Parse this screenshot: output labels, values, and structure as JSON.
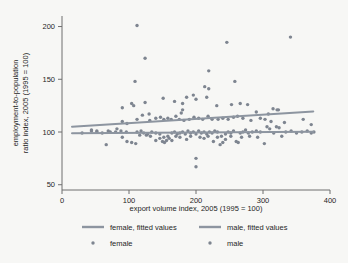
{
  "chart_data": {
    "type": "scatter",
    "title": "",
    "xlabel": "export volume index, 2005 (1995 = 100)",
    "ylabel": "employment-to-population ratio index, 2005 (1995 = 100)",
    "ylabel_line1": "employment-to-population",
    "ylabel_line2": "ratio index, 2005 (1995 = 100)",
    "xlim": [
      0,
      400
    ],
    "ylim": [
      45,
      210
    ],
    "xticks": [
      0,
      100,
      200,
      300,
      400
    ],
    "yticks": [
      50,
      100,
      150,
      200
    ],
    "xtick_labels": [
      "0",
      "100",
      "200",
      "300",
      "400"
    ],
    "ytick_labels": [
      "50",
      "100",
      "150",
      "200"
    ],
    "grid": false,
    "legend_position": "bottom",
    "point_color": "#7e8590",
    "line_color": "#8d95a0",
    "background_color": "#f7f7f5",
    "legend": [
      {
        "key": "female-fitted",
        "label": "female, fitted values",
        "marker": "line"
      },
      {
        "key": "male-fitted",
        "label": "male, fitted values",
        "marker": "line"
      },
      {
        "key": "female",
        "label": "female",
        "marker": "dot"
      },
      {
        "key": "male",
        "label": "male",
        "marker": "dot"
      }
    ],
    "fitted_lines": [
      {
        "name": "female, fitted values",
        "x": [
          15,
          375
        ],
        "y": [
          105.0,
          119.5
        ]
      },
      {
        "name": "male, fitted values",
        "x": [
          15,
          375
        ],
        "y": [
          98.8,
          100.2
        ]
      }
    ],
    "series": [
      {
        "name": "female",
        "points": [
          [
            112,
            201
          ],
          [
            124,
            170
          ],
          [
            109,
            148
          ],
          [
            90,
            123
          ],
          [
            104,
            127
          ],
          [
            107,
            125
          ],
          [
            124,
            128
          ],
          [
            130,
            117
          ],
          [
            151,
            132
          ],
          [
            168,
            129
          ],
          [
            180,
            127
          ],
          [
            186,
            133
          ],
          [
            196,
            135
          ],
          [
            200,
            131
          ],
          [
            178,
            118
          ],
          [
            180,
            121
          ],
          [
            219,
            158
          ],
          [
            213,
            143
          ],
          [
            219,
            141
          ],
          [
            216,
            133
          ],
          [
            231,
            125
          ],
          [
            246,
            185
          ],
          [
            258,
            148
          ],
          [
            253,
            126
          ],
          [
            266,
            127
          ],
          [
            277,
            126
          ],
          [
            290,
            119
          ],
          [
            308,
            117
          ],
          [
            315,
            122
          ],
          [
            321,
            121
          ],
          [
            323,
            121
          ],
          [
            341,
            190
          ],
          [
            112,
            112
          ],
          [
            120,
            116
          ],
          [
            131,
            111
          ],
          [
            140,
            113
          ],
          [
            147,
            114
          ],
          [
            152,
            112
          ],
          [
            158,
            113
          ],
          [
            163,
            112
          ],
          [
            170,
            115
          ],
          [
            175,
            112
          ],
          [
            182,
            111
          ],
          [
            190,
            112
          ],
          [
            197,
            114
          ],
          [
            204,
            113
          ],
          [
            210,
            112
          ],
          [
            218,
            115
          ],
          [
            224,
            112
          ],
          [
            233,
            112
          ],
          [
            240,
            113
          ],
          [
            248,
            112
          ],
          [
            256,
            114
          ],
          [
            262,
            115
          ],
          [
            270,
            113
          ],
          [
            282,
            111
          ],
          [
            296,
            113
          ],
          [
            303,
            112
          ],
          [
            312,
            110
          ],
          [
            332,
            109
          ],
          [
            360,
            112
          ],
          [
            372,
            107
          ],
          [
            90,
            110
          ],
          [
            97,
            108
          ],
          [
            82,
            103
          ],
          [
            69,
            101
          ],
          [
            52,
            101
          ],
          [
            44,
            101
          ],
          [
            30,
            99
          ]
        ]
      },
      {
        "name": "male",
        "points": [
          [
            66,
            88
          ],
          [
            90,
            95
          ],
          [
            97,
            91
          ],
          [
            104,
            90
          ],
          [
            110,
            89
          ],
          [
            116,
            97
          ],
          [
            122,
            99
          ],
          [
            128,
            98
          ],
          [
            134,
            100
          ],
          [
            140,
            99
          ],
          [
            146,
            98
          ],
          [
            150,
            91
          ],
          [
            153,
            90
          ],
          [
            156,
            92
          ],
          [
            160,
            94
          ],
          [
            164,
            99
          ],
          [
            168,
            100
          ],
          [
            172,
            98
          ],
          [
            176,
            99
          ],
          [
            180,
            100
          ],
          [
            184,
            98
          ],
          [
            188,
            101
          ],
          [
            192,
            99
          ],
          [
            196,
            100
          ],
          [
            200,
            98
          ],
          [
            200,
            75
          ],
          [
            200,
            67
          ],
          [
            204,
            101
          ],
          [
            208,
            99
          ],
          [
            212,
            100
          ],
          [
            216,
            98
          ],
          [
            220,
            100
          ],
          [
            224,
            99
          ],
          [
            228,
            101
          ],
          [
            232,
            100
          ],
          [
            236,
            88
          ],
          [
            240,
            90
          ],
          [
            244,
            98
          ],
          [
            248,
            100
          ],
          [
            252,
            99
          ],
          [
            256,
            101
          ],
          [
            260,
            91
          ],
          [
            263,
            90
          ],
          [
            266,
            99
          ],
          [
            270,
            100
          ],
          [
            274,
            102
          ],
          [
            278,
            99
          ],
          [
            284,
            100
          ],
          [
            290,
            101
          ],
          [
            296,
            100
          ],
          [
            302,
            89
          ],
          [
            306,
            105
          ],
          [
            310,
            103
          ],
          [
            316,
            99
          ],
          [
            320,
            105
          ],
          [
            324,
            104
          ],
          [
            328,
            96
          ],
          [
            334,
            100
          ],
          [
            342,
            101
          ],
          [
            350,
            99
          ],
          [
            358,
            100
          ],
          [
            366,
            101
          ],
          [
            372,
            99
          ],
          [
            376,
            100
          ],
          [
            152,
            95
          ],
          [
            158,
            96
          ],
          [
            164,
            92
          ],
          [
            170,
            96
          ],
          [
            176,
            95
          ],
          [
            186,
            93
          ],
          [
            192,
            96
          ],
          [
            206,
            95
          ],
          [
            212,
            94
          ],
          [
            218,
            96
          ],
          [
            226,
            91
          ],
          [
            232,
            95
          ],
          [
            238,
            96
          ],
          [
            244,
            93
          ],
          [
            252,
            96
          ],
          [
            268,
            95
          ],
          [
            280,
            96
          ],
          [
            292,
            95
          ],
          [
            44,
            102
          ],
          [
            52,
            100
          ],
          [
            60,
            99
          ],
          [
            72,
            100
          ],
          [
            80,
            100
          ],
          [
            88,
            101
          ],
          [
            96,
            100
          ],
          [
            140,
            92
          ],
          [
            146,
            94
          ],
          [
            132,
            96
          ],
          [
            126,
            97
          ],
          [
            118,
            101
          ],
          [
            112,
            100
          ]
        ]
      }
    ]
  }
}
